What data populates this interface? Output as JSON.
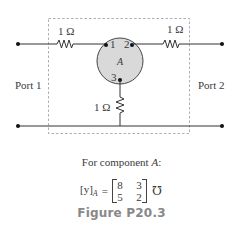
{
  "diagram": {
    "type": "two-port circuit",
    "component": {
      "label": "A",
      "fill_color": "#d9d9d9",
      "terminals": [
        {
          "id": "1",
          "label": "1"
        },
        {
          "id": "2",
          "label": "2"
        },
        {
          "id": "3",
          "label": "3"
        }
      ]
    },
    "resistors": [
      {
        "id": "r-top-left",
        "label": "1 Ω"
      },
      {
        "id": "r-top-right",
        "label": "1 Ω"
      },
      {
        "id": "r-vertical",
        "label": "1 Ω"
      }
    ],
    "ports": [
      {
        "id": "port-1",
        "label": "Port 1"
      },
      {
        "id": "port-2",
        "label": "Port 2"
      }
    ]
  },
  "caption": {
    "intro_prefix": "For component ",
    "intro_var": "A",
    "intro_suffix": ":",
    "matrix_lhs": "[y]",
    "matrix_lhs_sub": "A",
    "equals": "=",
    "matrix": [
      [
        "8",
        "3"
      ],
      [
        "5",
        "2"
      ]
    ],
    "unit": "℧",
    "figure_title": "Figure P20.3"
  }
}
